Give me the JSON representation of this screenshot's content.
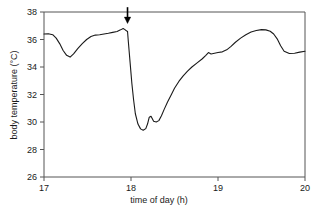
{
  "chart_data": {
    "type": "line",
    "title": "",
    "xlabel": "time of day (h)",
    "ylabel": "body temperature (°C)",
    "xlim": [
      17,
      20
    ],
    "ylim": [
      26,
      38
    ],
    "xticks": [
      17,
      18,
      19,
      20
    ],
    "xtick_labels": [
      "17",
      "18",
      "19",
      "20"
    ],
    "yticks": [
      26,
      28,
      30,
      32,
      34,
      36,
      38
    ],
    "ytick_labels": [
      "26",
      "28",
      "30",
      "32",
      "34",
      "36",
      "38"
    ],
    "grid": false,
    "legend": false,
    "line_color": "#1a1a1a",
    "frame_color": "#555555",
    "annotations": [
      {
        "name": "down-arrow",
        "type": "arrow",
        "x": 17.96,
        "y_tip": 37.25,
        "y_tail": 38.35,
        "direction": "down",
        "label": ""
      }
    ],
    "series": [
      {
        "name": "body temperature",
        "x": [
          17.0,
          17.05,
          17.1,
          17.14,
          17.18,
          17.22,
          17.26,
          17.3,
          17.34,
          17.39,
          17.44,
          17.49,
          17.54,
          17.59,
          17.64,
          17.69,
          17.74,
          17.79,
          17.84,
          17.88,
          17.91,
          17.93,
          17.95,
          17.96,
          17.97,
          17.99,
          18.01,
          18.03,
          18.05,
          18.08,
          18.11,
          18.14,
          18.17,
          18.19,
          18.21,
          18.23,
          18.26,
          18.29,
          18.32,
          18.35,
          18.38,
          18.42,
          18.46,
          18.5,
          18.55,
          18.6,
          18.65,
          18.7,
          18.76,
          18.82,
          18.86,
          18.89,
          18.92,
          18.96,
          19.0,
          19.05,
          19.1,
          19.15,
          19.2,
          19.26,
          19.32,
          19.38,
          19.44,
          19.5,
          19.55,
          19.6,
          19.64,
          19.68,
          19.72,
          19.76,
          19.82,
          19.88,
          19.94,
          20.0
        ],
        "y": [
          36.4,
          36.42,
          36.35,
          36.1,
          35.7,
          35.2,
          34.85,
          34.72,
          34.95,
          35.35,
          35.7,
          36.0,
          36.22,
          36.32,
          36.35,
          36.4,
          36.45,
          36.52,
          36.58,
          36.7,
          36.8,
          36.72,
          36.62,
          36.6,
          35.8,
          34.3,
          32.8,
          31.6,
          30.6,
          29.85,
          29.5,
          29.4,
          29.52,
          29.85,
          30.35,
          30.42,
          30.05,
          30.0,
          30.1,
          30.45,
          30.9,
          31.45,
          31.95,
          32.45,
          32.95,
          33.35,
          33.7,
          34.0,
          34.3,
          34.6,
          34.85,
          35.05,
          34.95,
          35.0,
          35.05,
          35.1,
          35.25,
          35.5,
          35.8,
          36.1,
          36.35,
          36.55,
          36.65,
          36.72,
          36.7,
          36.6,
          36.4,
          36.05,
          35.55,
          35.15,
          34.98,
          35.0,
          35.08,
          35.15
        ]
      }
    ]
  }
}
